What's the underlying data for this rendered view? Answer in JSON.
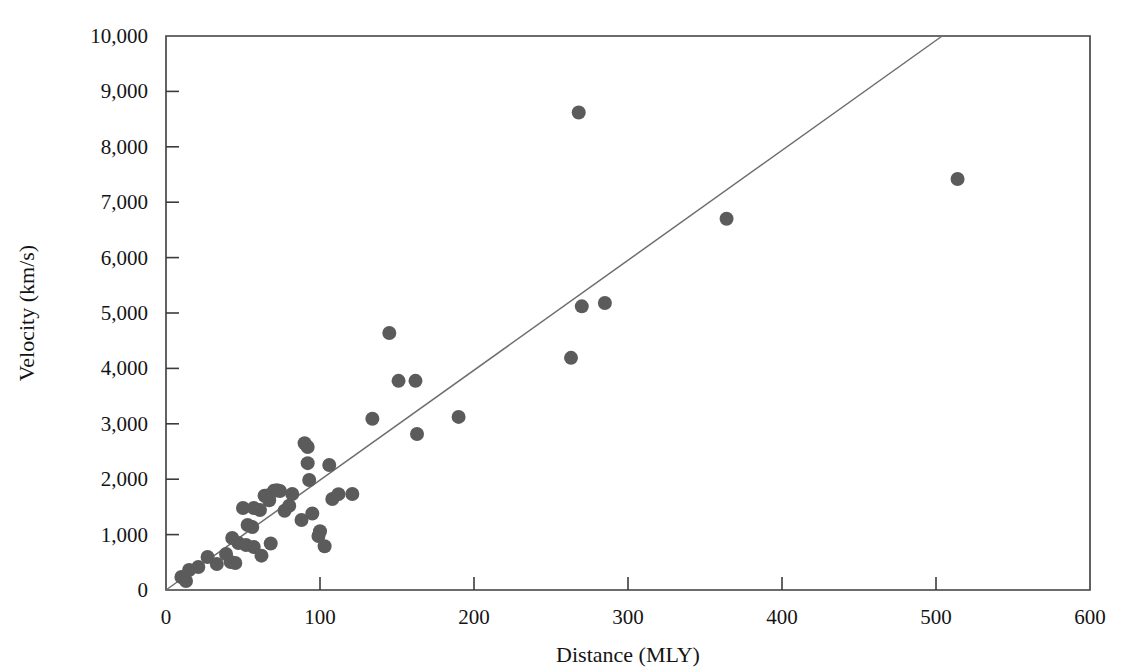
{
  "chart_data": {
    "type": "scatter",
    "title": "",
    "xlabel": "Distance (MLY)",
    "ylabel": "Velocity (km/s)",
    "xlim": [
      0,
      600
    ],
    "ylim": [
      0,
      10000
    ],
    "xticks": [
      0,
      100,
      200,
      300,
      400,
      500,
      600
    ],
    "xtick_labels": [
      "0",
      "100",
      "200",
      "300",
      "400",
      "500",
      "600"
    ],
    "yticks": [
      0,
      1000,
      2000,
      3000,
      4000,
      5000,
      6000,
      7000,
      8000,
      9000,
      10000
    ],
    "ytick_labels": [
      "0",
      "1,000",
      "2,000",
      "3,000",
      "4,000",
      "5,000",
      "6,000",
      "7,000",
      "8,000",
      "9,000",
      "10,000"
    ],
    "grid": false,
    "legend": null,
    "marker_color": "#5b5b5b",
    "marker_radius_px": 7,
    "fit_line": {
      "name": "Hubble law fit",
      "color": "#6e6e6e",
      "x0": 0,
      "y0": 0,
      "x1": 504,
      "y1": 10000,
      "slope_km_s_per_mly": 19.8
    },
    "series": [
      {
        "name": "Galaxies",
        "points": [
          [
            10,
            235
          ],
          [
            13,
            162
          ],
          [
            15,
            361
          ],
          [
            21,
            415
          ],
          [
            27,
            596
          ],
          [
            33,
            470
          ],
          [
            39,
            650
          ],
          [
            42,
            505
          ],
          [
            45,
            487
          ],
          [
            47,
            848
          ],
          [
            50,
            1480
          ],
          [
            52,
            812
          ],
          [
            53,
            1173
          ],
          [
            56,
            1137
          ],
          [
            57,
            776
          ],
          [
            57,
            1480
          ],
          [
            61,
            1445
          ],
          [
            43,
            938
          ],
          [
            62,
            620
          ],
          [
            64,
            1700
          ],
          [
            66,
            1705
          ],
          [
            67,
            1620
          ],
          [
            68,
            840
          ],
          [
            70,
            1790
          ],
          [
            72,
            1800
          ],
          [
            74,
            1787
          ],
          [
            77,
            1430
          ],
          [
            80,
            1520
          ],
          [
            82,
            1733
          ],
          [
            88,
            1263
          ],
          [
            90,
            2650
          ],
          [
            92,
            2580
          ],
          [
            92,
            2290
          ],
          [
            93,
            1985
          ],
          [
            95,
            1380
          ],
          [
            99,
            975
          ],
          [
            100,
            1060
          ],
          [
            103,
            790
          ],
          [
            106,
            2255
          ],
          [
            108,
            1642
          ],
          [
            112,
            1730
          ],
          [
            121,
            1733
          ],
          [
            134,
            3090
          ],
          [
            145,
            4640
          ],
          [
            151,
            3775
          ],
          [
            162,
            3775
          ],
          [
            163,
            2815
          ],
          [
            190,
            3125
          ],
          [
            263,
            4190
          ],
          [
            268,
            8620
          ],
          [
            270,
            5120
          ],
          [
            285,
            5180
          ],
          [
            364,
            6700
          ],
          [
            514,
            7420
          ]
        ]
      }
    ]
  }
}
